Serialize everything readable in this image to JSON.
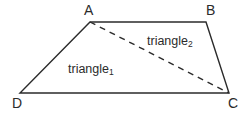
{
  "figure": {
    "canvas": {
      "width": 249,
      "height": 118,
      "background": "#ffffff"
    },
    "stroke_color": "#2b2b2b",
    "solid_stroke_width": 1.4,
    "dashed_stroke_width": 1.4,
    "dash_pattern": "6 5",
    "vertices": [
      {
        "id": "A",
        "label": "A",
        "x": 90,
        "y": 22
      },
      {
        "id": "B",
        "label": "B",
        "x": 206,
        "y": 22
      },
      {
        "id": "C",
        "label": "C",
        "x": 229,
        "y": 93
      },
      {
        "id": "D",
        "label": "D",
        "x": 20,
        "y": 93
      }
    ],
    "solid_edges": [
      {
        "name": "edge-AB",
        "from": "A",
        "to": "B"
      },
      {
        "name": "edge-BC",
        "from": "B",
        "to": "C"
      },
      {
        "name": "edge-CD",
        "from": "C",
        "to": "D"
      },
      {
        "name": "edge-DA",
        "from": "D",
        "to": "A"
      }
    ],
    "dashed_edges": [
      {
        "name": "diagonal-AC",
        "from": "A",
        "to": "C"
      }
    ],
    "outline_path": "M 90 22 L 206 22 L 229 93 L 20 93 Z",
    "diagonal_path": "M 90 22 L 229 93",
    "region_labels": [
      {
        "id": "triangle-1",
        "text": "triangle",
        "subscript": "1"
      },
      {
        "id": "triangle-2",
        "text": "triangle",
        "subscript": "2"
      }
    ]
  }
}
